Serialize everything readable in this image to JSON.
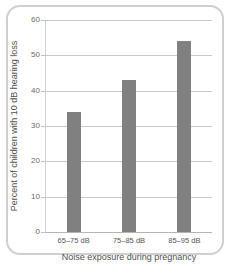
{
  "chart_data": {
    "type": "bar",
    "title": "",
    "categories": [
      "65–75 dB",
      "75–85 dB",
      "85–95 dB"
    ],
    "values": [
      34,
      43,
      54
    ],
    "series": [
      {
        "name": "Percent of children with 10 dB hearing loss",
        "values": [
          34,
          43,
          54
        ]
      }
    ],
    "xlabel": "Noise exposure during pregnancy",
    "ylabel": "Percent of children with 10 dB hearing loss",
    "ylim": [
      0,
      60
    ],
    "yticks": [
      0,
      10,
      20,
      30,
      40,
      50,
      60
    ],
    "ytick_labels": [
      "0",
      "10",
      "20",
      "30",
      "40",
      "50",
      "60"
    ],
    "grid": "horizontal",
    "legend": "none",
    "bar_color": "#808080",
    "gridline_color": "#c8c8c8",
    "frame_color": "#cfcfcf",
    "background": "#ffffff"
  },
  "figure": {
    "frame_label": "chart-frame",
    "artifact_text": " "
  }
}
